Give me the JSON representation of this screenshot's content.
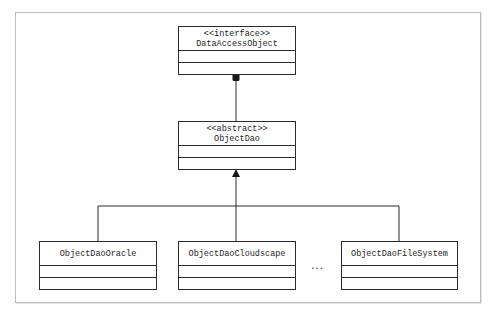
{
  "diagram": {
    "type": "uml-class-diagram",
    "classes": [
      {
        "id": "data-access-object",
        "stereotype": "<<interface>>",
        "name": "DataAccessObject"
      },
      {
        "id": "object-dao",
        "stereotype": "<<abstract>>",
        "name": "ObjectDao"
      },
      {
        "id": "object-dao-oracle",
        "stereotype": "",
        "name": "ObjectDaoOracle"
      },
      {
        "id": "object-dao-cloudscape",
        "stereotype": "",
        "name": "ObjectDaoCloudscape"
      },
      {
        "id": "object-dao-filesystem",
        "stereotype": "",
        "name": "ObjectDaoFileSystem"
      }
    ],
    "relations": [
      {
        "from": "object-dao",
        "to": "data-access-object",
        "kind": "composition/realization (filled marker)"
      },
      {
        "from": "object-dao-oracle",
        "to": "object-dao",
        "kind": "inheritance"
      },
      {
        "from": "object-dao-cloudscape",
        "to": "object-dao",
        "kind": "inheritance"
      },
      {
        "from": "object-dao-filesystem",
        "to": "object-dao",
        "kind": "inheritance"
      }
    ],
    "ellipsis": "...",
    "colors": {
      "line": "#2b2b2b",
      "frame": "#bdbdbd",
      "background": "#ffffff"
    }
  }
}
